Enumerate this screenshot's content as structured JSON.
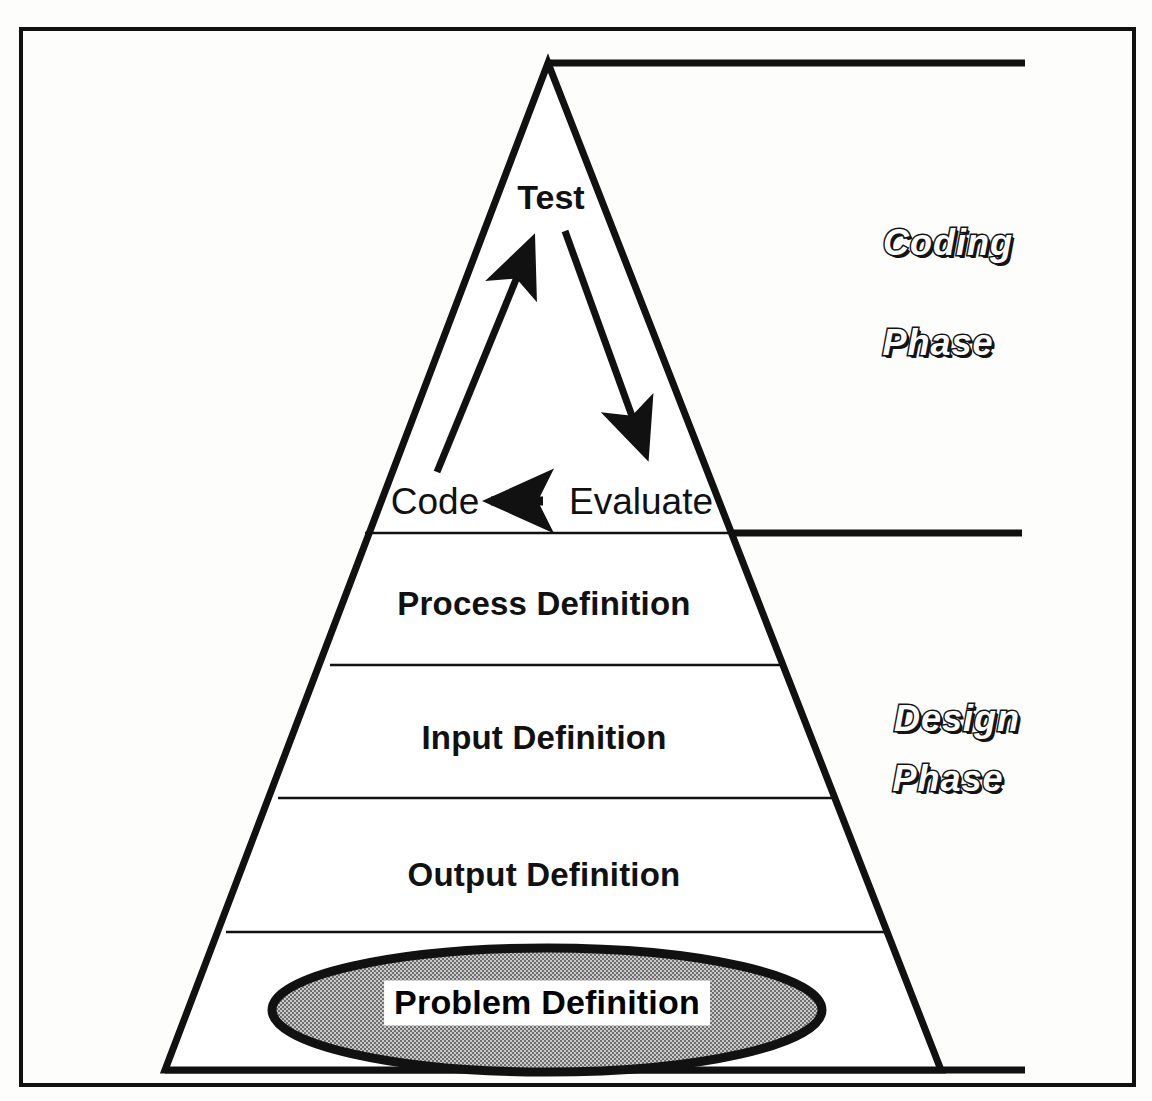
{
  "diagram": {
    "frame": {
      "border_color": "#111111"
    },
    "pyramid": {
      "apex_label": "apex",
      "outline_color": "#111111",
      "tiers": [
        {
          "id": "tier-process",
          "label": "Process Definition"
        },
        {
          "id": "tier-input",
          "label": "Input Definition"
        },
        {
          "id": "tier-output",
          "label": "Output Definition"
        },
        {
          "id": "tier-problem",
          "label": "Problem Definition"
        }
      ]
    },
    "flow": {
      "test_label": "Test",
      "code_label": "Code",
      "evaluate_label": "Evaluate",
      "arrows": [
        {
          "id": "code-to-test",
          "from": "Code",
          "to": "Test",
          "direction": "up"
        },
        {
          "id": "test-to-evaluate",
          "from": "Test",
          "to": "Evaluate",
          "direction": "down"
        },
        {
          "id": "evaluate-to-code",
          "from": "Evaluate",
          "to": "Code",
          "direction": "left"
        }
      ]
    },
    "phases": [
      {
        "id": "coding-phase",
        "line1": "Coding",
        "line2": "Phase"
      },
      {
        "id": "design-phase",
        "line1": "Design",
        "line2": "Phase"
      }
    ],
    "colors": {
      "ink": "#111111",
      "ellipse_fill": "#a8a8a8",
      "ellipse_stroke": "#111111",
      "plate": "#ffffff",
      "background": "#fdfdfc"
    }
  }
}
